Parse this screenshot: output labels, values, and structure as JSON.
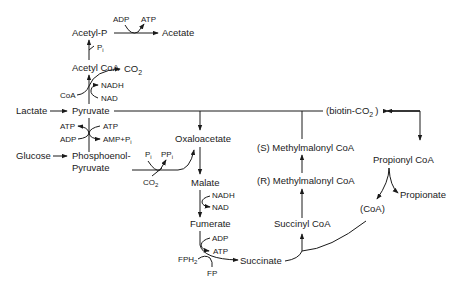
{
  "diagram": {
    "title": "",
    "nodes": {
      "acetyl_p": "Acetyl-P",
      "acetate": "Acetate",
      "acetyl_coa": "Acetyl CoA",
      "co2_top": "CO",
      "co2_top_sub": "2",
      "lactate": "Lactate",
      "pyruvate": "Pyruvate",
      "biotin_co2": "(biotin-CO",
      "biotin_co2_sub": "2",
      "biotin_close": ")",
      "glucose": "Glucose",
      "pep_line1": "Phosphoenol-",
      "pep_line2": "Pyruvate",
      "oxaloacetate": "Oxaloacetate",
      "malate": "Malate",
      "fumerate": "Fumerate",
      "succinate": "Succinate",
      "succinyl_coa": "Succinyl CoA",
      "r_methylmalonyl": "(R)  Methylmalonyl  CoA",
      "s_methylmalonyl": "(S)  Methylmalonyl CoA",
      "propionyl_coa": "Propionyl CoA",
      "propionate": "Propionate",
      "coa_paren": "(CoA)"
    },
    "cofactors": {
      "adp_top": "ADP",
      "atp_top": "ATP",
      "pi_top": "P",
      "pi_top_sub": "i",
      "coa": "CoA",
      "nadh_top": "NADH",
      "nad_top": "NAD",
      "atp_left": "ATP",
      "atp_right": "ATP",
      "adp_left": "ADP",
      "amp_pi": "AMP+P",
      "amp_pi_sub": "i",
      "pi_mid": "P",
      "pi_mid_sub": "i",
      "ppi_mid": "PP",
      "ppi_mid_sub": "i",
      "co2_mid": "CO",
      "co2_mid_sub": "2",
      "nadh_mid": "NADH",
      "nad_mid": "NAD",
      "adp_bottom": "ADP",
      "atp_bottom": "ATP",
      "fph2": "FPH",
      "fph2_sub": "2",
      "fp": "FP"
    }
  }
}
